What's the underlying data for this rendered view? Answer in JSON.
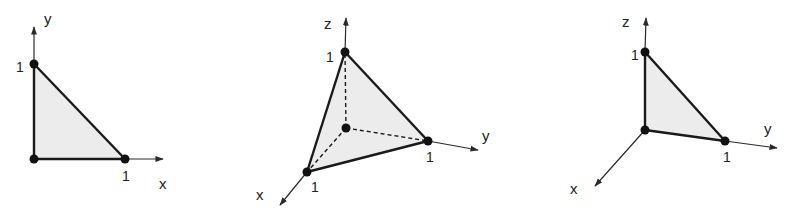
{
  "figure": {
    "colors": {
      "fill": "#ececec",
      "edge": "#1a1a1a",
      "axis": "#2a2a2a",
      "vertex": "#111111"
    },
    "panels": [
      {
        "id": "2d-triangle",
        "axes": {
          "y": "y",
          "x": "x"
        },
        "ticks": {
          "y": "1",
          "x": "1"
        }
      },
      {
        "id": "3d-tetrahedron",
        "axes": {
          "z": "z",
          "y": "y",
          "x": "x"
        },
        "ticks": {
          "z": "1",
          "y": "1",
          "x": "1"
        }
      },
      {
        "id": "3d-yz-triangle",
        "axes": {
          "z": "z",
          "y": "y",
          "x": "x"
        },
        "ticks": {
          "z": "1",
          "y": "1"
        }
      }
    ]
  }
}
